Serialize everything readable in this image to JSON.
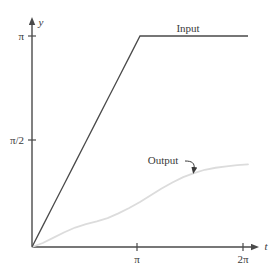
{
  "figure": {
    "background_color": "#ffffff",
    "axis_color": "#4a4a4a"
  },
  "axes": {
    "x_axis_name": "t",
    "y_axis_name": "y",
    "x_ticks": [
      {
        "label": "π",
        "value": 3.1416
      },
      {
        "label": "2π",
        "value": 6.2832
      }
    ],
    "y_ticks": [
      {
        "label": "π/2",
        "value": 1.5708
      },
      {
        "label": "π",
        "value": 3.1416
      }
    ],
    "xlim": [
      0,
      6.2832
    ],
    "ylim": [
      0,
      3.1416
    ],
    "grid": false
  },
  "labels": {
    "input": "Input",
    "output": "Output"
  },
  "chart_data": {
    "type": "line",
    "title": "",
    "xlabel": "t",
    "ylabel": "y",
    "xlim": [
      0,
      6.2832
    ],
    "ylim": [
      0,
      3.1416
    ],
    "grid": false,
    "legend_position": "inline-annotations",
    "x_ticks": [
      "π",
      "2π"
    ],
    "y_ticks": [
      "π/2",
      "π"
    ],
    "annotations": [
      {
        "text": "Input",
        "target_x": 4.6,
        "target_y": 3.1416,
        "note": "label placed above the saturated plateau of the input ramp"
      },
      {
        "text": "Output",
        "target_x": 4.45,
        "target_y": 1.18,
        "arrow": true,
        "note": "curved leader line with arrowhead pointing down-right onto the output curve"
      }
    ],
    "series": [
      {
        "name": "Input",
        "color": "#4a4a4a",
        "width": 1.3,
        "description": "Ramp rising linearly from the origin to (π, π), then held constant at π through 2π",
        "x": [
          0,
          0.3142,
          0.6283,
          0.9425,
          1.2566,
          1.5708,
          1.885,
          2.1991,
          2.5133,
          2.8274,
          3.1416,
          3.4558,
          3.7699,
          4.0841,
          4.3982,
          4.7124,
          5.0265,
          5.3407,
          5.6549,
          5.969,
          6.2832
        ],
        "y": [
          0,
          0.3142,
          0.6283,
          0.9425,
          1.2566,
          1.5708,
          1.885,
          2.1991,
          2.5133,
          2.8274,
          3.1416,
          3.1416,
          3.1416,
          3.1416,
          3.1416,
          3.1416,
          3.1416,
          3.1416,
          3.1416,
          3.1416,
          3.1416
        ]
      },
      {
        "name": "Output",
        "color": "#dcdcdc",
        "width": 1.6,
        "description": "Slow lagging S-shaped response starting flat at the origin, inflecting near t=π and levelling off near y=1.2 by 2π",
        "x": [
          0,
          0.3142,
          0.6283,
          0.9425,
          1.2566,
          1.5708,
          1.885,
          2.1991,
          2.5133,
          2.8274,
          3.1416,
          3.4558,
          3.7699,
          4.0841,
          4.3982,
          4.7124,
          5.0265,
          5.3407,
          5.6549,
          5.969,
          6.2832
        ],
        "y": [
          0,
          0.06,
          0.14,
          0.22,
          0.29,
          0.34,
          0.38,
          0.43,
          0.5,
          0.58,
          0.67,
          0.77,
          0.87,
          0.96,
          1.04,
          1.1,
          1.15,
          1.18,
          1.2,
          1.22,
          1.23
        ]
      }
    ]
  }
}
